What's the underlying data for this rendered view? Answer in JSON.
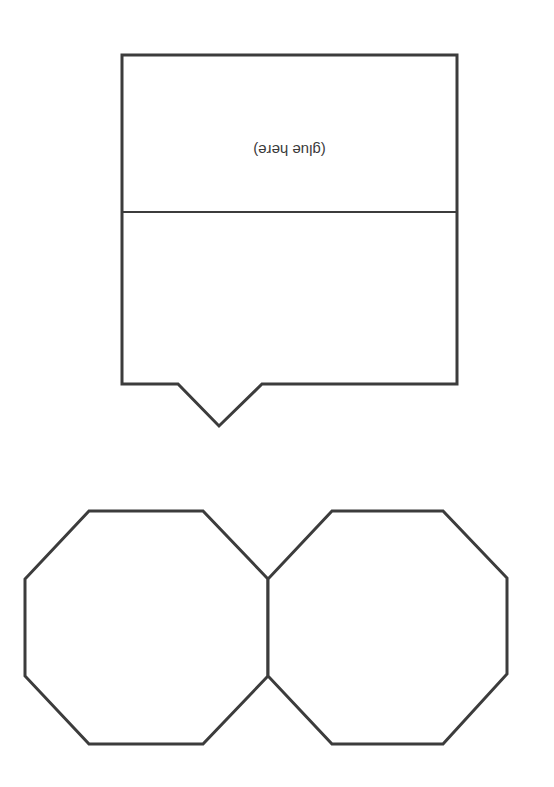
{
  "template": {
    "type": "paper craft net / cut-out template",
    "box_panel": {
      "label": "(glue here)",
      "label_orientation": "upside-down",
      "has_fold_line": true,
      "has_bottom_tab": true
    },
    "octagons": [
      {
        "name": "left-octagon",
        "sides": 8
      },
      {
        "name": "right-octagon",
        "sides": 8
      }
    ],
    "colors": {
      "stroke": "#3c3c3c",
      "background": "#ffffff",
      "text": "#3a3a3a"
    }
  }
}
